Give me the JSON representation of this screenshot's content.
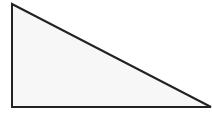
{
  "diagram": {
    "type": "right-triangle",
    "vertices": {
      "top_left": [
        12,
        4
      ],
      "bottom_left": [
        12,
        107
      ],
      "bottom_right": [
        211,
        107
      ]
    },
    "right_angle_at": "bottom_left",
    "colors": {
      "fill": "#f7f7f7",
      "stroke": "#222222",
      "background": "#ffffff"
    },
    "stroke_width": 2
  }
}
